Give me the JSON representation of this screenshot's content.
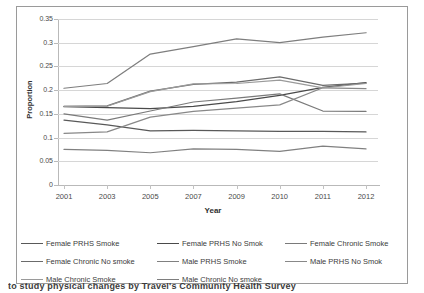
{
  "chart_data": {
    "type": "line",
    "title": "",
    "xlabel": "Year",
    "ylabel": "Proportion",
    "categories": [
      "2001",
      "2003",
      "2005",
      "2007",
      "2009",
      "2010",
      "2011",
      "2012"
    ],
    "x": [
      2001,
      2003,
      2005,
      2007,
      2009,
      2010,
      2011,
      2012
    ],
    "ylim": [
      0,
      0.35
    ],
    "yticks": [
      "0",
      "0.05",
      "0.1",
      "0.15",
      "0.2",
      "0.25",
      "0.3",
      "0.35"
    ],
    "ytick_values": [
      0,
      0.05,
      0.1,
      0.15,
      0.2,
      0.25,
      0.3,
      0.35
    ],
    "grid": true,
    "legend_position": "bottom",
    "series": [
      {
        "name": "Female PRHS  Smoke",
        "color": "#595959",
        "values": [
          0.137,
          0.127,
          0.114,
          0.115,
          0.114,
          0.113,
          0.113,
          0.112
        ]
      },
      {
        "name": "Female PRHS  No Smok",
        "color": "#4a4a4a",
        "values": [
          0.165,
          0.163,
          0.161,
          0.166,
          0.176,
          0.189,
          0.206,
          0.216
        ]
      },
      {
        "name": "Female Chronic  Smoke",
        "color": "#7a7a7a",
        "values": [
          0.15,
          0.137,
          0.156,
          0.175,
          0.183,
          0.192,
          0.156,
          0.155
        ]
      },
      {
        "name": "Female Chronic  No smoke",
        "color": "#6b6b6b",
        "values": [
          0.166,
          0.167,
          0.198,
          0.212,
          0.217,
          0.228,
          0.21,
          0.215
        ]
      },
      {
        "name": "Male PRHS  Smoke",
        "color": "#808080",
        "values": [
          0.075,
          0.073,
          0.068,
          0.076,
          0.075,
          0.071,
          0.082,
          0.076
        ]
      },
      {
        "name": "Male PRHS  No Smok",
        "color": "#888888",
        "values": [
          0.109,
          0.112,
          0.143,
          0.155,
          0.162,
          0.169,
          0.205,
          0.203
        ]
      },
      {
        "name": "Male Chronic  Smoke",
        "color": "#9a9a9a",
        "values": [
          0.166,
          0.166,
          0.197,
          0.213,
          0.214,
          0.221,
          0.205,
          0.214
        ]
      },
      {
        "name": "Male Chronic  No smoke",
        "color": "#7e7e7e",
        "values": [
          0.204,
          0.214,
          0.276,
          0.292,
          0.308,
          0.3,
          0.312,
          0.321
        ]
      }
    ]
  },
  "axes": {
    "y_title": "Proportion",
    "x_title": "Year"
  },
  "caption": {
    "bleed_text": "to study physical changes by Travel's Community Health Survey"
  }
}
